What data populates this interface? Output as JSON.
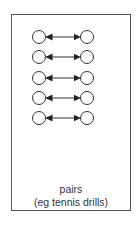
{
  "diagram": {
    "type": "formation",
    "rows": 5,
    "row_centers_y": [
      37,
      57,
      78,
      98,
      118
    ],
    "left_circle_cx": 39,
    "right_circle_cx": 87,
    "circle_radius": 6.5,
    "connector": "double-headed-arrow",
    "colors": {
      "stroke": "#333333",
      "fill": "#ffffff",
      "frame": "#555555"
    }
  },
  "caption": {
    "title": "pairs",
    "subtitle": "(eg tennis drills)"
  }
}
